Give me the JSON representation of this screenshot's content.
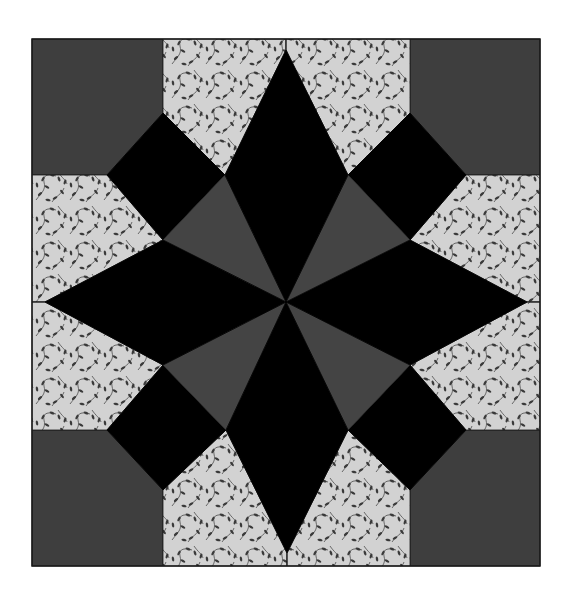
{
  "figure": {
    "caption": ""
  },
  "colors": {
    "background": "#ffffff",
    "corner_fabric": "#3e3e3e",
    "triangle_fabric": "#444444",
    "star_fabric": "#000000",
    "print_fabric_base": "#d2d2d2",
    "print_fabric_motif": "#3a3a3a",
    "seam": "#1a1a1a"
  },
  "block": {
    "x0": 32,
    "y0": 39,
    "x1": 540,
    "y1": 566,
    "center": [
      286,
      302
    ]
  },
  "pieces": {
    "corner_squares": [
      {
        "name": "corner-square-top-left",
        "points": [
          [
            32,
            39
          ],
          [
            163,
            39
          ],
          [
            163,
            113
          ],
          [
            107,
            175
          ],
          [
            32,
            175
          ]
        ]
      },
      {
        "name": "corner-square-top-right",
        "points": [
          [
            410,
            39
          ],
          [
            540,
            39
          ],
          [
            540,
            175
          ],
          [
            466,
            175
          ],
          [
            410,
            113
          ]
        ]
      },
      {
        "name": "corner-square-bottom-left",
        "points": [
          [
            32,
            430
          ],
          [
            107,
            430
          ],
          [
            163,
            490
          ],
          [
            163,
            566
          ],
          [
            32,
            566
          ]
        ]
      },
      {
        "name": "corner-square-bottom-right",
        "points": [
          [
            466,
            430
          ],
          [
            540,
            430
          ],
          [
            540,
            566
          ],
          [
            410,
            566
          ],
          [
            410,
            490
          ]
        ]
      }
    ],
    "print_pieces": [
      {
        "name": "print-top-left",
        "points": [
          [
            163,
            39
          ],
          [
            286,
            39
          ],
          [
            286,
            50
          ],
          [
            225,
            175
          ],
          [
            163,
            113
          ]
        ]
      },
      {
        "name": "print-top-right",
        "points": [
          [
            286,
            39
          ],
          [
            410,
            39
          ],
          [
            410,
            113
          ],
          [
            348,
            175
          ],
          [
            286,
            50
          ]
        ]
      },
      {
        "name": "print-left-top",
        "points": [
          [
            32,
            175
          ],
          [
            107,
            175
          ],
          [
            163,
            240
          ],
          [
            45,
            302
          ],
          [
            32,
            302
          ]
        ]
      },
      {
        "name": "print-left-bottom",
        "points": [
          [
            32,
            302
          ],
          [
            45,
            302
          ],
          [
            163,
            365
          ],
          [
            107,
            430
          ],
          [
            32,
            430
          ]
        ]
      },
      {
        "name": "print-right-top",
        "points": [
          [
            466,
            175
          ],
          [
            540,
            175
          ],
          [
            540,
            302
          ],
          [
            527,
            302
          ],
          [
            410,
            240
          ]
        ]
      },
      {
        "name": "print-right-bottom",
        "points": [
          [
            527,
            302
          ],
          [
            540,
            302
          ],
          [
            540,
            430
          ],
          [
            466,
            430
          ],
          [
            410,
            365
          ]
        ]
      },
      {
        "name": "print-bottom-left",
        "points": [
          [
            163,
            490
          ],
          [
            226,
            430
          ],
          [
            287,
            553
          ],
          [
            287,
            566
          ],
          [
            163,
            566
          ]
        ]
      },
      {
        "name": "print-bottom-right",
        "points": [
          [
            348,
            430
          ],
          [
            410,
            490
          ],
          [
            410,
            566
          ],
          [
            287,
            566
          ],
          [
            287,
            553
          ]
        ]
      }
    ],
    "black_squares": [
      {
        "name": "square-top-left",
        "points": [
          [
            163,
            113
          ],
          [
            225,
            175
          ],
          [
            163,
            240
          ],
          [
            107,
            175
          ]
        ]
      },
      {
        "name": "square-top-right",
        "points": [
          [
            410,
            113
          ],
          [
            466,
            175
          ],
          [
            410,
            240
          ],
          [
            348,
            175
          ]
        ]
      },
      {
        "name": "square-bottom-left",
        "points": [
          [
            107,
            430
          ],
          [
            163,
            365
          ],
          [
            226,
            430
          ],
          [
            163,
            490
          ]
        ]
      },
      {
        "name": "square-bottom-right",
        "points": [
          [
            410,
            365
          ],
          [
            466,
            430
          ],
          [
            410,
            490
          ],
          [
            348,
            430
          ]
        ]
      }
    ],
    "star_diamonds": [
      {
        "name": "diamond-top",
        "points": [
          [
            286,
            50
          ],
          [
            348,
            175
          ],
          [
            286,
            302
          ],
          [
            225,
            175
          ]
        ]
      },
      {
        "name": "diamond-bottom",
        "points": [
          [
            286,
            302
          ],
          [
            348,
            430
          ],
          [
            287,
            553
          ],
          [
            226,
            430
          ]
        ]
      },
      {
        "name": "diamond-left",
        "points": [
          [
            45,
            302
          ],
          [
            163,
            240
          ],
          [
            286,
            302
          ],
          [
            163,
            365
          ]
        ]
      },
      {
        "name": "diamond-right",
        "points": [
          [
            286,
            302
          ],
          [
            410,
            240
          ],
          [
            527,
            302
          ],
          [
            410,
            365
          ]
        ]
      }
    ],
    "gray_triangles": [
      {
        "name": "triangle-top-left",
        "points": [
          [
            225,
            175
          ],
          [
            286,
            302
          ],
          [
            163,
            240
          ]
        ]
      },
      {
        "name": "triangle-top-right",
        "points": [
          [
            348,
            175
          ],
          [
            410,
            240
          ],
          [
            286,
            302
          ]
        ]
      },
      {
        "name": "triangle-bottom-left",
        "points": [
          [
            163,
            365
          ],
          [
            286,
            302
          ],
          [
            226,
            430
          ]
        ]
      },
      {
        "name": "triangle-bottom-right",
        "points": [
          [
            286,
            302
          ],
          [
            410,
            365
          ],
          [
            348,
            430
          ]
        ]
      }
    ]
  }
}
